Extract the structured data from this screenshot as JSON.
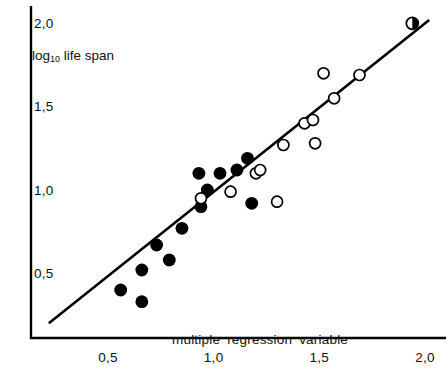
{
  "chart_data": {
    "type": "scatter",
    "title": "",
    "xlabel": "multiple  regression  variable",
    "ylabel": "log10 life span",
    "ylabel_base": "log",
    "ylabel_sub": "10",
    "ylabel_rest": " life span",
    "xlim": [
      0.18,
      2.06
    ],
    "ylim": [
      0.17,
      2.09
    ],
    "grid": false,
    "legend": "none",
    "xticks": [
      0.5,
      1.0,
      1.5,
      2.0
    ],
    "xtick_labels": [
      "0,5",
      "1,0",
      "1,5",
      "2,0"
    ],
    "yticks": [
      0.5,
      1.0,
      1.5,
      2.0
    ],
    "ytick_labels": [
      "0,5",
      "1,0",
      "1,5",
      "2,0"
    ],
    "reference_line": {
      "name": "identity-line",
      "x": [
        0.22,
        2.02
      ],
      "y": [
        0.21,
        2.03
      ]
    },
    "series": [
      {
        "name": "filled-circles",
        "marker": "filled-circle",
        "color": "#000000",
        "points": [
          {
            "x": 0.56,
            "y": 0.41
          },
          {
            "x": 0.66,
            "y": 0.34
          },
          {
            "x": 0.66,
            "y": 0.53
          },
          {
            "x": 0.79,
            "y": 0.59
          },
          {
            "x": 0.73,
            "y": 0.68
          },
          {
            "x": 0.85,
            "y": 0.78
          },
          {
            "x": 0.94,
            "y": 0.91
          },
          {
            "x": 0.97,
            "y": 1.01
          },
          {
            "x": 0.93,
            "y": 1.11
          },
          {
            "x": 1.03,
            "y": 1.11
          },
          {
            "x": 1.11,
            "y": 1.13
          },
          {
            "x": 1.16,
            "y": 1.2
          },
          {
            "x": 1.18,
            "y": 0.93
          }
        ]
      },
      {
        "name": "open-circles",
        "marker": "open-circle",
        "color": "#000000",
        "points": [
          {
            "x": 0.94,
            "y": 0.96
          },
          {
            "x": 1.08,
            "y": 1.0
          },
          {
            "x": 1.2,
            "y": 1.11
          },
          {
            "x": 1.22,
            "y": 1.13
          },
          {
            "x": 1.3,
            "y": 0.94
          },
          {
            "x": 1.33,
            "y": 1.28
          },
          {
            "x": 1.43,
            "y": 1.41
          },
          {
            "x": 1.47,
            "y": 1.43
          },
          {
            "x": 1.48,
            "y": 1.29
          },
          {
            "x": 1.52,
            "y": 1.71
          },
          {
            "x": 1.57,
            "y": 1.56
          },
          {
            "x": 1.69,
            "y": 1.7
          }
        ]
      },
      {
        "name": "half-filled-circle",
        "marker": "half-filled-circle",
        "color": "#000000",
        "points": [
          {
            "x": 1.94,
            "y": 2.01
          }
        ]
      }
    ]
  },
  "axes": {
    "y_title_base": "log",
    "y_title_sub": "10",
    "y_title_rest": "life span",
    "x_title_words": [
      "multiple",
      "regression",
      "variable"
    ]
  }
}
